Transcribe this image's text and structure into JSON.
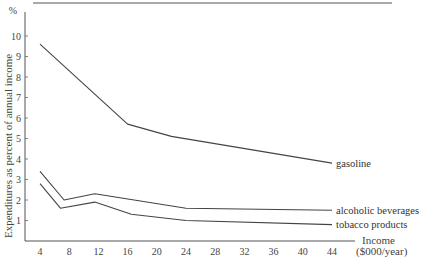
{
  "chart_data": {
    "type": "line",
    "title": "",
    "xlabel": "Income ($000/year)",
    "xlabel_line1": "Income",
    "xlabel_line2": "($000/year)",
    "ylabel": "Expenditures as percent of annual income",
    "yunit": "%",
    "xlim": [
      4,
      44
    ],
    "ylim": [
      0,
      10
    ],
    "xticks": [
      4,
      8,
      12,
      16,
      20,
      24,
      28,
      32,
      36,
      40,
      44
    ],
    "yticks": [
      1,
      2,
      3,
      4,
      5,
      6,
      7,
      8,
      9,
      10
    ],
    "grid": false,
    "legend_position": "inline labels at right end of each line",
    "series": [
      {
        "name": "gasoline",
        "x": [
          4,
          16,
          22,
          44
        ],
        "values": [
          9.6,
          5.7,
          5.1,
          3.8
        ]
      },
      {
        "name": "alcoholic beverages",
        "x": [
          4,
          7.3,
          11.5,
          24,
          44
        ],
        "values": [
          3.4,
          2.0,
          2.3,
          1.6,
          1.5
        ]
      },
      {
        "name": "tobacco products",
        "x": [
          4,
          6.8,
          11.5,
          16.5,
          24,
          44
        ],
        "values": [
          2.8,
          1.6,
          1.9,
          1.3,
          1.0,
          0.8
        ]
      }
    ]
  }
}
